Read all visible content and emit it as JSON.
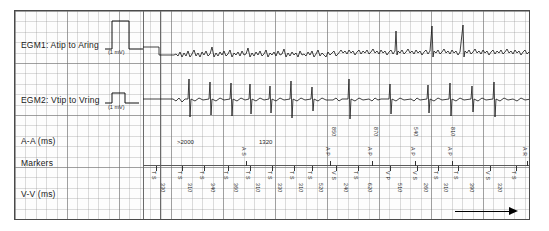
{
  "chart_data": {
    "type": "line",
    "channels": [
      {
        "name": "EGM1",
        "label": "EGM1: Atip to Aring",
        "calibration": "(1 mV)",
        "signal": "atrial electrogram, fibrillatory baseline with intermittent large deflections"
      },
      {
        "name": "EGM2",
        "label": "EGM2: Vtip to Vring",
        "calibration": "(1 mV)",
        "signal": "ventricular electrogram, discrete QRS complexes"
      }
    ],
    "rows": [
      "A-A (ms)",
      "Markers",
      "V-V (ms)"
    ],
    "grid": "ECG graph paper, minor 10px / major 52px",
    "xlabel": "time",
    "ylabel": "amplitude (mV)"
  },
  "frame": {
    "labels": {
      "egm1": "EGM1: Atip to Aring",
      "egm1_cal": "(1 mV)",
      "egm2": "EGM2: Vtip to Vring",
      "egm2_cal": "(1 mV)",
      "aa": "A-A (ms)",
      "markers": "Markers",
      "vv": "V-V (ms)"
    }
  },
  "aa_row": {
    "horizontal": [
      {
        "x": 176,
        "text": ">2000"
      },
      {
        "x": 258,
        "text": "1320"
      },
      {
        "x": 336,
        "text": "850"
      },
      {
        "x": 378,
        "text": "870"
      },
      {
        "x": 418,
        "text": "540"
      },
      {
        "x": 455,
        "text": "810"
      }
    ]
  },
  "markers_row": {
    "above": [
      {
        "x": 246,
        "text": "A S"
      },
      {
        "x": 330,
        "text": "A P"
      },
      {
        "x": 372,
        "text": "A P"
      },
      {
        "x": 415,
        "text": "A P"
      },
      {
        "x": 452,
        "text": "A P"
      },
      {
        "x": 527,
        "text": "A R"
      }
    ],
    "below": [
      {
        "x": 156,
        "text": "T S"
      },
      {
        "x": 182,
        "text": "T S"
      },
      {
        "x": 204,
        "text": "T S"
      },
      {
        "x": 228,
        "text": "T S"
      },
      {
        "x": 250,
        "text": "T S"
      },
      {
        "x": 272,
        "text": "T S"
      },
      {
        "x": 294,
        "text": "T S"
      },
      {
        "x": 312,
        "text": "T S"
      },
      {
        "x": 336,
        "text": "V S"
      },
      {
        "x": 358,
        "text": "T S"
      },
      {
        "x": 390,
        "text": "V P"
      },
      {
        "x": 417,
        "text": "V S"
      },
      {
        "x": 438,
        "text": "T S"
      },
      {
        "x": 458,
        "text": "T S"
      },
      {
        "x": 490,
        "text": "V S"
      },
      {
        "x": 516,
        "text": "T S"
      }
    ]
  },
  "vv_row": {
    "values": [
      {
        "x": 165,
        "text": "330"
      },
      {
        "x": 192,
        "text": "310"
      },
      {
        "x": 215,
        "text": "340"
      },
      {
        "x": 238,
        "text": "360"
      },
      {
        "x": 260,
        "text": "310"
      },
      {
        "x": 282,
        "text": "330"
      },
      {
        "x": 303,
        "text": "310"
      },
      {
        "x": 323,
        "text": "520"
      },
      {
        "x": 348,
        "text": "240"
      },
      {
        "x": 372,
        "text": "620"
      },
      {
        "x": 402,
        "text": "510"
      },
      {
        "x": 428,
        "text": "260"
      },
      {
        "x": 448,
        "text": "310"
      },
      {
        "x": 474,
        "text": "390"
      },
      {
        "x": 502,
        "text": "320"
      }
    ]
  },
  "time_arrow": {
    "name": "time-direction-arrow"
  },
  "colors": {
    "trace": "#111111",
    "frame": "#4a4a4a",
    "grid_minor": "#8c8c8c",
    "grid_major": "#6e6e6e",
    "text": "#1a1a1a"
  }
}
